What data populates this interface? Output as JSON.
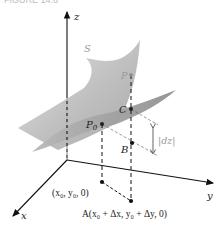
{
  "header": {
    "partial_title": "FIGURE 14.6"
  },
  "colors": {
    "axis": "#111111",
    "surface_light": "#d8d8d8",
    "surface_dark": "#a9a9a9",
    "plane_light": "#c4c4c4",
    "plane_dark": "#9b9b9b",
    "label": "#222222",
    "label_grey": "#9a9a9a"
  },
  "axes": {
    "x": "x",
    "y": "y",
    "z": "z"
  },
  "labels": {
    "surface": "S",
    "P": "P",
    "P0": "P",
    "P0_sub": "0",
    "C": "C",
    "B": "B",
    "dz": "|dz|",
    "base_point": "(x₀, y₀, 0)",
    "A_point": "A(x₀ + Δx, y₀ + Δy, 0)"
  }
}
